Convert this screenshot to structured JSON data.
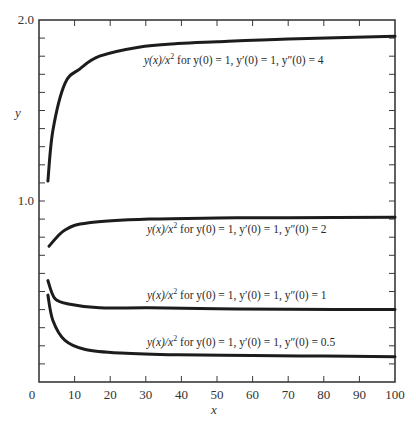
{
  "chart_data": {
    "type": "line",
    "title": "",
    "xlabel": "x",
    "ylabel": "y",
    "xlim": [
      0,
      100
    ],
    "ylim": [
      0,
      2.0
    ],
    "x_ticks": [
      0,
      10,
      20,
      30,
      40,
      50,
      60,
      70,
      80,
      90,
      100
    ],
    "x_tick_labels": [
      "0",
      "10",
      "20",
      "30",
      "40",
      "50",
      "60",
      "70",
      "80",
      "90",
      "100"
    ],
    "y_tick_labels": [
      {
        "value": 2.0,
        "label": "2.0"
      },
      {
        "value": 1.0,
        "label": "1.0"
      }
    ],
    "y_minor_step": 0.1,
    "grid": false,
    "legend": "none (inline annotations)",
    "series": [
      {
        "name": "y(x)/x^2 for y(0) = 1, y'(0) = 1, y''(0) = 4",
        "label_parts": {
          "lhs": "y(x)/x",
          "exp": "2",
          "rest": " for y(0) = 1, y′(0) = 1, y″(0) = 4"
        },
        "label_pos": [
          144,
          64
        ],
        "x": [
          2.5,
          3.9,
          7.3,
          11.5,
          17,
          28,
          39,
          50,
          70,
          100
        ],
        "y": [
          1.11,
          1.39,
          1.65,
          1.73,
          1.8,
          1.85,
          1.87,
          1.88,
          1.895,
          1.91
        ]
      },
      {
        "name": "y(x)/x^2 for y(0) = 1, y'(0) = 1, y''(0) = 2",
        "label_parts": {
          "lhs": "y(x)/x",
          "exp": "2",
          "rest": " for y(0) = 1, y′(0) = 1, y″(0) = 2"
        },
        "label_pos": [
          147,
          233
        ],
        "x": [
          2.8,
          7.3,
          14,
          31,
          50,
          70,
          100
        ],
        "y": [
          0.75,
          0.84,
          0.88,
          0.9,
          0.906,
          0.908,
          0.91
        ]
      },
      {
        "name": "y(x)/x^2 for y(0) = 1, y'(0) = 1, y''(0) = 1",
        "label_parts": {
          "lhs": "y(x)/x",
          "exp": "2",
          "rest": " for y(0) = 1, y′(0) = 1, y″(0) = 1"
        },
        "label_pos": [
          147,
          299
        ],
        "x": [
          2.5,
          4.5,
          8.7,
          17,
          31,
          50,
          70,
          100
        ],
        "y": [
          0.56,
          0.46,
          0.43,
          0.41,
          0.41,
          0.405,
          0.402,
          0.4
        ]
      },
      {
        "name": "y(x)/x^2 for y(0) = 1, y'(0) = 1, y''(0) = 0.5",
        "label_parts": {
          "lhs": "y(x)/x",
          "exp": "2",
          "rest": " for y(0) = 1, y′(0) = 1, y″(0) = 0.5"
        },
        "label_pos": [
          147,
          346
        ],
        "x": [
          2.5,
          3.9,
          7.3,
          13,
          23,
          39,
          60,
          80,
          100
        ],
        "y": [
          0.48,
          0.34,
          0.23,
          0.18,
          0.16,
          0.15,
          0.147,
          0.143,
          0.14
        ]
      }
    ]
  },
  "frame": {
    "left": 39,
    "right": 395,
    "top": 20,
    "bottom": 382
  },
  "colors": {
    "curve": "#1c1c1c",
    "axis": "#3a3a3a",
    "text": "#333333",
    "background": "#ffffff"
  }
}
